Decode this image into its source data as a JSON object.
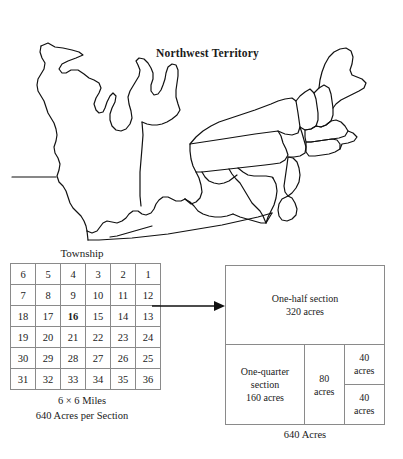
{
  "map": {
    "title": "Northwest Territory",
    "region_label": "Northwest Territory"
  },
  "township": {
    "label": "Township",
    "grid_rows": [
      [
        "6",
        "5",
        "4",
        "3",
        "2",
        "1"
      ],
      [
        "7",
        "8",
        "9",
        "10",
        "11",
        "12"
      ],
      [
        "18",
        "17",
        "16",
        "15",
        "14",
        "13"
      ],
      [
        "19",
        "20",
        "21",
        "22",
        "23",
        "24"
      ],
      [
        "30",
        "29",
        "28",
        "27",
        "26",
        "25"
      ],
      [
        "31",
        "32",
        "33",
        "34",
        "35",
        "36"
      ]
    ],
    "highlighted_cell": "16",
    "caption_size": "6 × 6 Miles",
    "caption_acres": "640 Acres per Section"
  },
  "section": {
    "half_section_label": "One-half section",
    "half_section_acres": "320 acres",
    "quarter_section_label": "One-quarter section",
    "quarter_section_acres": "160 acres",
    "eighty_value": "80",
    "eighty_unit": "acres",
    "forty_top_value": "40",
    "forty_top_unit": "acres",
    "forty_bottom_value": "40",
    "forty_bottom_unit": "acres",
    "caption": "640 Acres"
  },
  "connector": {
    "arrow_name": "arrow-right"
  },
  "colors": {
    "ink": "#1a1a1a",
    "rule": "#8a8a8a",
    "background": "#ffffff"
  }
}
